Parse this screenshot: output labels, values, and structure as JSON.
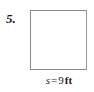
{
  "figure": {
    "problem_number": "5.",
    "shape": {
      "name": "square",
      "border_color": "#8a8a8a",
      "fill_color": "#ffffff"
    },
    "side_label": {
      "full_text": "s = 9 ft",
      "variable": "s",
      "equals": "=",
      "value": "9",
      "unit": "ft"
    }
  }
}
